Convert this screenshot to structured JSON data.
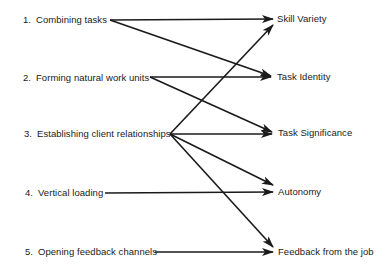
{
  "left_nodes": [
    {
      "num": "1.",
      "label": "Combining  tasks"
    },
    {
      "num": "2.",
      "label": "Forming natural work units"
    },
    {
      "num": "3.",
      "label": "Establishing client relationships"
    },
    {
      "num": "4.",
      "label": "Vertical loading"
    },
    {
      "num": "5.",
      "label": "Opening feedback channels"
    }
  ],
  "right_nodes": [
    {
      "label": "Skill Variety"
    },
    {
      "label": "Task Identity"
    },
    {
      "label": "Task Significance"
    },
    {
      "label": "Autonomy"
    },
    {
      "label": "Feedback from the job"
    }
  ],
  "connections": [
    {
      "from": 1,
      "to": "Skill Variety"
    },
    {
      "from": 1,
      "to": "Task Identity"
    },
    {
      "from": 2,
      "to": "Task Identity"
    },
    {
      "from": 2,
      "to": "Task Significance"
    },
    {
      "from": 3,
      "to": "Skill Variety"
    },
    {
      "from": 3,
      "to": "Task Significance"
    },
    {
      "from": 3,
      "to": "Autonomy"
    },
    {
      "from": 3,
      "to": "Feedback from the job"
    },
    {
      "from": 4,
      "to": "Autonomy"
    },
    {
      "from": 5,
      "to": "Feedback from the job"
    }
  ],
  "colors": {
    "line": "#1a1a1a",
    "text": "#1a1a1a",
    "background": "#ffffff"
  }
}
